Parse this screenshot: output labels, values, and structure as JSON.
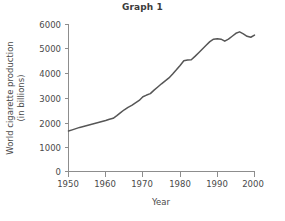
{
  "chart_data": {
    "type": "line",
    "title": "Graph 1",
    "xlabel": "Year",
    "ylabel": "World cigarette production (in billions)",
    "ylabel_line1": "World cigarette production",
    "ylabel_line2": "(in billions)",
    "xlim": [
      1950,
      2000
    ],
    "ylim": [
      0,
      6000
    ],
    "xticks": [
      1950,
      1960,
      1970,
      1980,
      1990,
      2000
    ],
    "xtick_labels": [
      "1950",
      "1960",
      "1970",
      "1980",
      "1990",
      "2000"
    ],
    "yticks": [
      0,
      1000,
      2000,
      3000,
      4000,
      5000,
      6000
    ],
    "ytick_labels": [
      "0",
      "1000",
      "2000",
      "3000",
      "4000",
      "5000",
      "6000"
    ],
    "grid": false,
    "legend": false,
    "line_color": "#565656",
    "axis_color": "#8d8d8d",
    "background": "#ffffff",
    "x": [
      1950,
      1951,
      1952,
      1953,
      1954,
      1955,
      1956,
      1957,
      1958,
      1959,
      1960,
      1961,
      1962,
      1963,
      1964,
      1965,
      1966,
      1967,
      1968,
      1969,
      1970,
      1971,
      1972,
      1973,
      1974,
      1975,
      1976,
      1977,
      1978,
      1979,
      1980,
      1981,
      1982,
      1983,
      1984,
      1985,
      1986,
      1987,
      1988,
      1989,
      1990,
      1991,
      1992,
      1993,
      1994,
      1995,
      1996,
      1997,
      1998,
      1999,
      2000
    ],
    "values": [
      1650,
      1700,
      1750,
      1800,
      1840,
      1880,
      1920,
      1960,
      2000,
      2040,
      2080,
      2130,
      2170,
      2280,
      2400,
      2520,
      2620,
      2700,
      2800,
      2900,
      3050,
      3120,
      3180,
      3320,
      3450,
      3580,
      3700,
      3820,
      3980,
      4150,
      4330,
      4520,
      4550,
      4560,
      4700,
      4850,
      5000,
      5150,
      5300,
      5400,
      5420,
      5400,
      5320,
      5400,
      5520,
      5640,
      5700,
      5620,
      5520,
      5480,
      5570
    ],
    "series": [
      {
        "name": "World cigarette production",
        "values": [
          1650,
          1700,
          1750,
          1800,
          1840,
          1880,
          1920,
          1960,
          2000,
          2040,
          2080,
          2130,
          2170,
          2280,
          2400,
          2520,
          2620,
          2700,
          2800,
          2900,
          3050,
          3120,
          3180,
          3320,
          3450,
          3580,
          3700,
          3820,
          3980,
          4150,
          4330,
          4520,
          4550,
          4560,
          4700,
          4850,
          5000,
          5150,
          5300,
          5400,
          5420,
          5400,
          5320,
          5400,
          5520,
          5640,
          5700,
          5620,
          5520,
          5480,
          5570
        ]
      }
    ]
  }
}
